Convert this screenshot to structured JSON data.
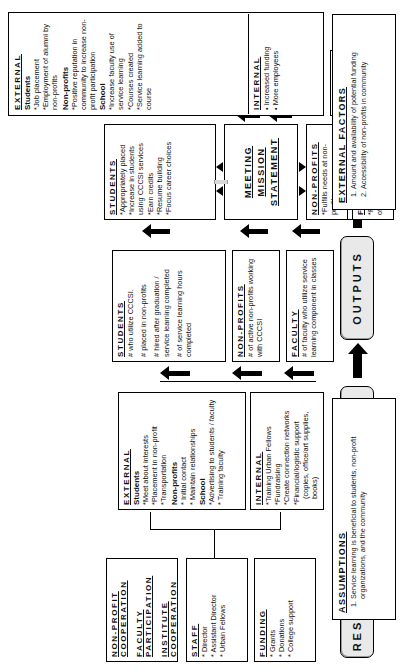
{
  "diagram": {
    "orientation": "rotated-90-ccw",
    "stages": [
      {
        "key": "resources",
        "label": "RESOURCES"
      },
      {
        "key": "activities",
        "label": "ACTIVITIES"
      },
      {
        "key": "outputs",
        "label": "OUTPUTS"
      },
      {
        "key": "outcomes",
        "label": "OUTCOMES"
      }
    ]
  },
  "resources": {
    "staff": {
      "header": "STAFF",
      "items": [
        "* Director",
        "* Assistant Director",
        "* Urban Fellows"
      ]
    },
    "funding": {
      "header": "FUNDING",
      "items": [
        "* Grants",
        "* Donations",
        "* College support"
      ]
    },
    "cooperation": {
      "items": [
        "NON-PROFIT COOPERATION",
        "FACULTY PARTICIPATION",
        "INSTITUTE COOPERATION"
      ]
    }
  },
  "activities": {
    "external": {
      "header": "EXTERNAL",
      "groups": [
        {
          "name": "Students",
          "items": [
            "*Meet about interests",
            "*Placement in non-profit",
            "*Transportation"
          ]
        },
        {
          "name": "Non-profits",
          "items": [
            "* Initial contact",
            "* Maintain relationships"
          ]
        },
        {
          "name": "School",
          "items": [
            "*Advertising to students / faculty",
            "* Training faculty"
          ]
        }
      ]
    },
    "internal": {
      "header": "INTERNAL",
      "items": [
        "*Training Urban Fellows",
        "*Fundraising",
        "*Create connection networks",
        "*Financial/logistic support (copies, office/art supplies, books)"
      ]
    }
  },
  "outputs": {
    "students": {
      "header": "STUDENTS",
      "items": [
        "# who utilize CCCSI.",
        "# placed in non-profits",
        "# hired after graduation / service learning completed",
        "# of service learning hours completed"
      ]
    },
    "nonprofits": {
      "header": "NON-PROFITS",
      "items": [
        "# of active non-profits working with CCCSI"
      ]
    },
    "faculty": {
      "header": "FACULTY",
      "items": [
        "# of faculty who utilize service learning component in classes"
      ]
    }
  },
  "outcomes": {
    "short_term": {
      "label": "Short-term",
      "students": {
        "header": "STUDENTS",
        "items": [
          "*Appropriately placed",
          "*Increase in students using CCCSI services",
          "*Earn credits",
          "*Resume building",
          "*Focus career choices"
        ]
      },
      "mission": {
        "lines": [
          "MEETING",
          "MISSION",
          "STATEMENT"
        ]
      },
      "nonprofits": {
        "header": "NON-PROFITS",
        "items": [
          "*Fulfills needs at non-profits"
        ]
      },
      "faculty": {
        "header": "FACULTY",
        "items": [
          "*Faculty appreciate merits of service-learning"
        ]
      }
    },
    "long_term": {
      "label": "Long-term",
      "external": {
        "header": "EXTERNAL",
        "groups": [
          {
            "name": "Students",
            "items": [
              "*Job placement",
              "*Employment of alumni by non-profits"
            ]
          },
          {
            "name": "Non-profits",
            "items": [
              "*Positive reputation in community to increase non-profit participation"
            ]
          },
          {
            "name": "School",
            "items": [
              "*Increase faculty use of service learning",
              "*Courses created",
              "*Service learning added to course"
            ]
          }
        ]
      },
      "internal": {
        "header": "INTERNAL",
        "items": [
          "• Increased funding",
          "• More employees"
        ]
      }
    }
  },
  "external_factors": {
    "title": "EXTERNAL FACTORS",
    "items": [
      "Amount and availability of potential funding",
      "Accessibility of non-profits in community"
    ]
  },
  "assumptions": {
    "title": "ASSUMPTIONS",
    "items": [
      "Service learning is beneficial to students, non-profit organizations, and the community"
    ]
  },
  "colors": {
    "chip_fill": "#e9e9e9",
    "line": "#000000",
    "feed_arrow": "#d8d8d8",
    "background": "#ffffff"
  }
}
